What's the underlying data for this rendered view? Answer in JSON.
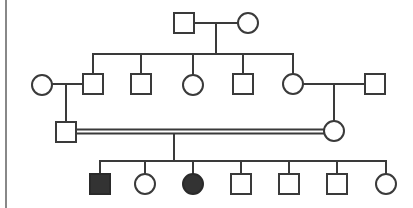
{
  "diagram": {
    "type": "pedigree",
    "colors": {
      "line": "#3a3a3a",
      "affected_fill": "#333333",
      "unaffected_fill": "#ffffff",
      "border": "#888888"
    },
    "generations": [
      {
        "id": "I",
        "individuals": [
          {
            "id": "I-1",
            "sex": "male",
            "affected": false
          },
          {
            "id": "I-2",
            "sex": "female",
            "affected": false
          }
        ]
      },
      {
        "id": "II",
        "individuals": [
          {
            "id": "II-1",
            "sex": "female",
            "affected": false,
            "note": "married-in spouse of II-2"
          },
          {
            "id": "II-2",
            "sex": "male",
            "affected": false
          },
          {
            "id": "II-3",
            "sex": "male",
            "affected": false
          },
          {
            "id": "II-4",
            "sex": "female",
            "affected": false
          },
          {
            "id": "II-5",
            "sex": "male",
            "affected": false
          },
          {
            "id": "II-6",
            "sex": "female",
            "affected": false
          },
          {
            "id": "II-7",
            "sex": "male",
            "affected": false,
            "note": "married-in spouse of II-6"
          }
        ]
      },
      {
        "id": "III",
        "individuals": [
          {
            "id": "III-1",
            "sex": "male",
            "affected": false,
            "parents": [
              "II-1",
              "II-2"
            ]
          },
          {
            "id": "III-2",
            "sex": "female",
            "affected": false,
            "parents": [
              "II-6",
              "II-7"
            ]
          }
        ],
        "consanguineous_union": [
          "III-1",
          "III-2"
        ]
      },
      {
        "id": "IV",
        "individuals": [
          {
            "id": "IV-1",
            "sex": "male",
            "affected": true
          },
          {
            "id": "IV-2",
            "sex": "female",
            "affected": false
          },
          {
            "id": "IV-3",
            "sex": "female",
            "affected": true
          },
          {
            "id": "IV-4",
            "sex": "male",
            "affected": false
          },
          {
            "id": "IV-5",
            "sex": "male",
            "affected": false
          },
          {
            "id": "IV-6",
            "sex": "male",
            "affected": false
          },
          {
            "id": "IV-7",
            "sex": "female",
            "affected": false
          }
        ]
      }
    ]
  }
}
